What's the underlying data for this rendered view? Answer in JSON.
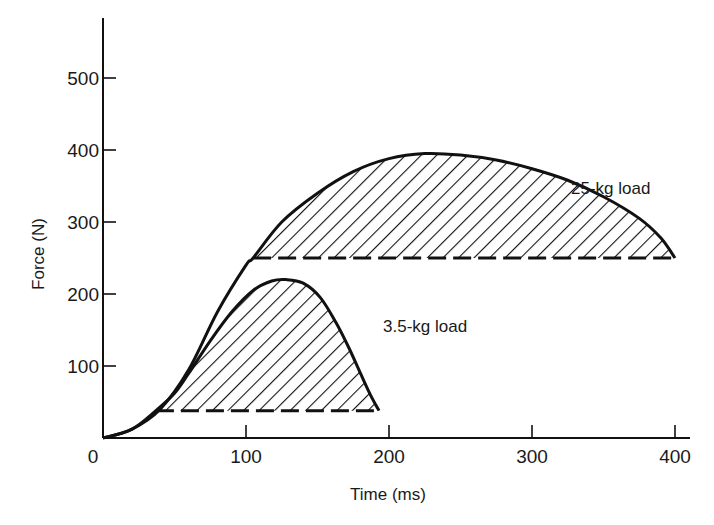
{
  "chart_data": {
    "type": "area",
    "title": "",
    "xlabel": "Time (ms)",
    "ylabel": "Force (N)",
    "xlim": [
      0,
      410
    ],
    "ylim": [
      0,
      560
    ],
    "x_ticks": [
      0,
      100,
      200,
      300,
      400
    ],
    "y_ticks": [
      100,
      200,
      300,
      400,
      500
    ],
    "x_tick_labels": [
      "0",
      "100",
      "200",
      "300",
      "400"
    ],
    "y_tick_labels": [
      "100",
      "200",
      "300",
      "400",
      "500"
    ],
    "grid": false,
    "legend": "none (inline annotations)",
    "series": [
      {
        "name": "25-kg load",
        "baseline_force": 250,
        "x": [
          0,
          20,
          40,
          60,
          80,
          100,
          105,
          125,
          150,
          175,
          200,
          225,
          250,
          275,
          300,
          325,
          350,
          375,
          390,
          400
        ],
        "values": [
          0,
          12,
          40,
          95,
          175,
          240,
          250,
          300,
          340,
          370,
          388,
          395,
          393,
          386,
          374,
          358,
          335,
          305,
          278,
          250
        ],
        "shaded_region": {
          "x_start": 105,
          "x_end": 400,
          "hatch": "diagonal"
        }
      },
      {
        "name": "3.5-kg load",
        "baseline_force": 38,
        "x": [
          0,
          20,
          37,
          50,
          60,
          75,
          90,
          105,
          118,
          128,
          140,
          152,
          163,
          172,
          180,
          187,
          193
        ],
        "values": [
          0,
          12,
          38,
          62,
          90,
          135,
          175,
          205,
          218,
          220,
          215,
          195,
          160,
          125,
          90,
          60,
          38
        ],
        "shaded_region": {
          "x_start": 37,
          "x_end": 193,
          "hatch": "diagonal"
        }
      }
    ],
    "annotations": [
      {
        "text": "25-kg load",
        "x": 330,
        "y": 395
      },
      {
        "text": "3.5-kg load",
        "x": 198,
        "y": 190
      }
    ]
  },
  "labels": {
    "xlabel": "Time (ms)",
    "ylabel": "Force (N)",
    "origin": "0",
    "annot_25": "25-kg load",
    "annot_35": "3.5-kg load"
  }
}
